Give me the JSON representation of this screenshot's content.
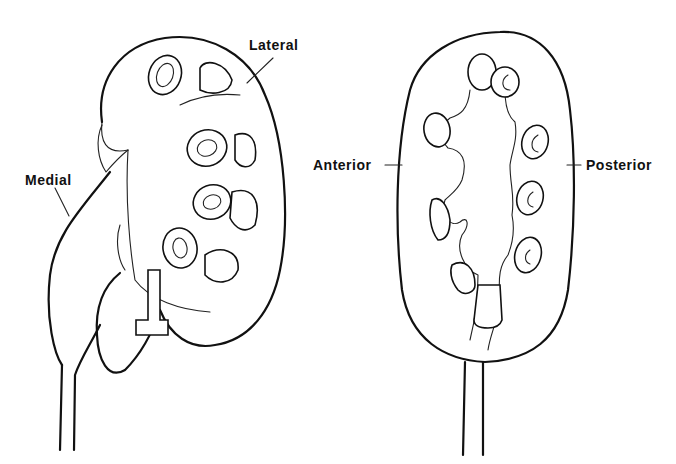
{
  "figure": {
    "left_view": {
      "labels": {
        "lateral": "Lateral",
        "medial": "Medial"
      }
    },
    "right_view": {
      "labels": {
        "anterior": "Anterior",
        "posterior": "Posterior"
      }
    },
    "line_color": "#111111",
    "background": "#ffffff"
  }
}
